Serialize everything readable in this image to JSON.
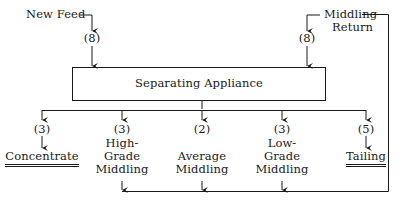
{
  "diagram": {
    "inputs": [
      {
        "label": "New Feed",
        "count": "(8)"
      },
      {
        "label_line1": "Middling",
        "label_line2": "Return",
        "count": "(8)"
      }
    ],
    "process": {
      "label": "Separating Appliance"
    },
    "outputs": [
      {
        "count": "(3)",
        "lines": [
          "Concentrate"
        ],
        "final_product": true
      },
      {
        "count": "(3)",
        "lines": [
          "High-",
          "Grade",
          "Middling"
        ],
        "final_product": false
      },
      {
        "count": "(2)",
        "lines": [
          "Average",
          "Middling"
        ],
        "final_product": false
      },
      {
        "count": "(3)",
        "lines": [
          "Low-",
          "Grade",
          "Middling"
        ],
        "final_product": false
      },
      {
        "count": "(5)",
        "lines": [
          "Tailing"
        ],
        "final_product": true
      }
    ],
    "line_color": "#1a1a1a"
  }
}
